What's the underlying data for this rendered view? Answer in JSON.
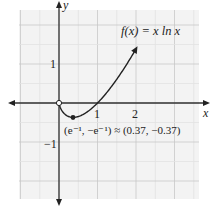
{
  "chart_data": {
    "type": "line",
    "title": "f(x) = x ln x",
    "function": "f(x) = x ln x",
    "xlabel": "x",
    "ylabel": "y",
    "xlim": [
      -1.05,
      3.6
    ],
    "ylim": [
      -2.45,
      2.4
    ],
    "x_ticks": [
      1,
      2
    ],
    "y_ticks": [
      1,
      -1
    ],
    "grid": true,
    "grid_minor_step": 0.5,
    "series": [
      {
        "name": "f(x) = x ln x",
        "x": [
          0,
          0.05,
          0.1,
          0.2,
          0.3,
          0.37,
          0.5,
          0.7,
          1.0,
          1.3,
          1.6,
          2.0
        ],
        "y": [
          0,
          -0.15,
          -0.23,
          -0.32,
          -0.36,
          -0.37,
          -0.35,
          -0.25,
          0,
          0.34,
          0.75,
          1.39
        ]
      }
    ],
    "annotations": [
      {
        "type": "open-point",
        "x": 0,
        "y": 0,
        "label": ""
      },
      {
        "type": "closed-point",
        "x": 0.37,
        "y": -0.37,
        "label": "(e⁻¹, −e⁻¹) ≈ (0.37, −0.37)"
      }
    ]
  },
  "labels": {
    "function": "f(x) = x ln x",
    "x_axis": "x",
    "y_axis": "y",
    "x_tick_1": "1",
    "x_tick_2": "2",
    "y_tick_1": "1",
    "y_tick_neg1": "−1",
    "min_point": "(e⁻¹, −e⁻¹) ≈ (0.37, −0.37)"
  },
  "colors": {
    "grid_minor": "#e2e2e2",
    "grid_major": "#c8c8c8",
    "background_grid": "#f2f2f2",
    "axis": "#333333",
    "curve": "#222222"
  }
}
